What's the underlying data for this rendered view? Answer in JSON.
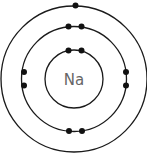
{
  "diagram": {
    "nucleus": {
      "symbol": "Na",
      "label_color": "#666666"
    },
    "line_color": "#1a1a1a",
    "electron_color": "#111111",
    "center": [
      74,
      79
    ],
    "shells": [
      {
        "name": "inner",
        "radius": 29,
        "electrons": 2
      },
      {
        "name": "middle",
        "radius": 52.5,
        "electrons": 8
      },
      {
        "name": "outer",
        "radius": 73,
        "electrons": 1
      }
    ]
  }
}
